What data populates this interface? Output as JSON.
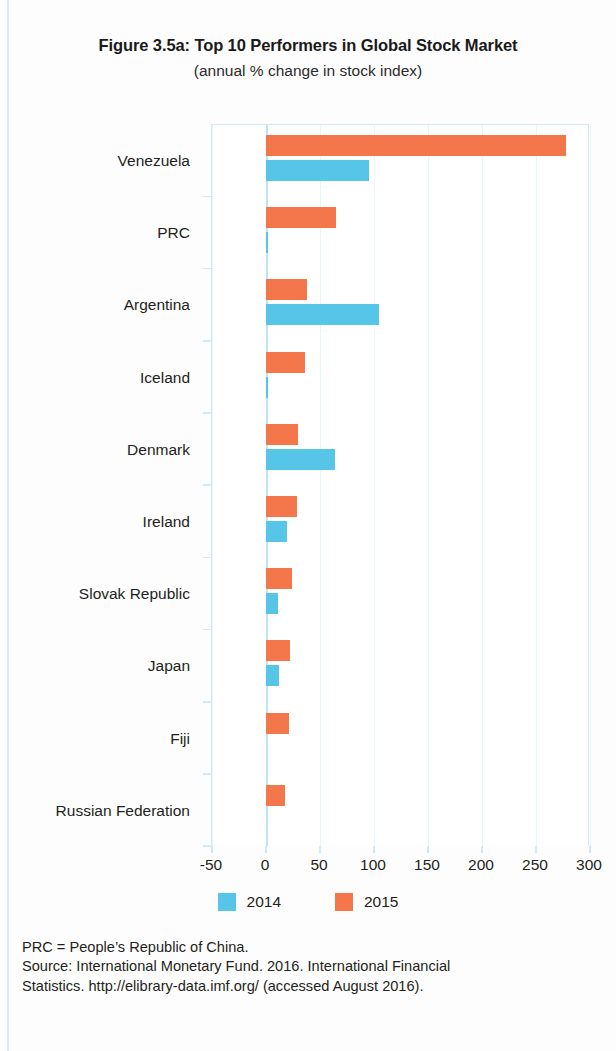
{
  "figure": {
    "title": "Figure 3.5a:  Top 10 Performers in Global Stock Market",
    "subtitle": "(annual % change in stock index)"
  },
  "legend": {
    "items": [
      {
        "label": "2014",
        "color": "#57c5e8"
      },
      {
        "label": "2015",
        "color": "#f4774b"
      }
    ]
  },
  "notes": {
    "abbreviation": "PRC = People’s Republic of China.",
    "source_line1": "Source:  International Monetary Fund. 2016. International Financial",
    "source_line2": "Statistics. http://elibrary-data.imf.org/ (accessed August 2016)."
  },
  "chart_data": {
    "type": "bar",
    "orientation": "horizontal",
    "title": "Figure 3.5a:  Top 10 Performers in Global Stock Market",
    "subtitle": "(annual % change in stock index)",
    "xlabel": "",
    "ylabel": "",
    "xlim": [
      -50,
      300
    ],
    "xticks": [
      -50,
      0,
      50,
      100,
      150,
      200,
      250,
      300
    ],
    "xtick_labels": [
      "-50",
      "0",
      "50",
      "100",
      "150",
      "200",
      "250",
      "300"
    ],
    "grid": true,
    "legend_position": "bottom",
    "categories": [
      "Venezuela",
      "PRC",
      "Argentina",
      "Iceland",
      "Denmark",
      "Ireland",
      "Slovak Republic",
      "Japan",
      "Fiji",
      "Russian Federation"
    ],
    "series": [
      {
        "name": "2014",
        "color": "#57c5e8",
        "values": [
          95,
          1,
          105,
          2,
          64,
          19,
          11,
          12,
          0,
          0
        ]
      },
      {
        "name": "2015",
        "color": "#f4774b",
        "values": [
          278,
          65,
          38,
          36,
          30,
          29,
          24,
          22,
          21,
          18
        ]
      }
    ]
  }
}
